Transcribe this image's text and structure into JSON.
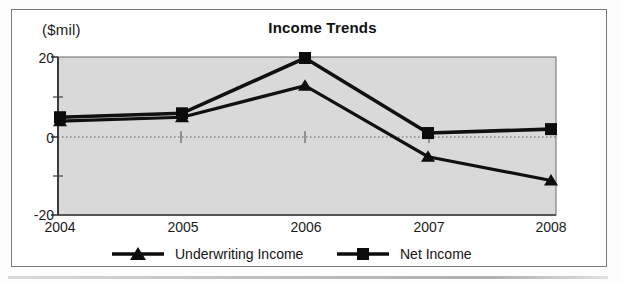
{
  "chart_data": {
    "type": "line",
    "title": "Income Trends",
    "xlabel": "",
    "ylabel": "($mil)",
    "unit_label": "($mil)",
    "categories": [
      "2004",
      "2005",
      "2006",
      "2007",
      "2008"
    ],
    "x": [
      2004,
      2005,
      2006,
      2007,
      2008
    ],
    "series": [
      {
        "name": "Underwriting Income",
        "marker": "triangle",
        "color": "#111111",
        "values": [
          4,
          5,
          13,
          -5,
          -11
        ]
      },
      {
        "name": "Net Income",
        "marker": "square",
        "color": "#111111",
        "values": [
          5,
          6,
          20,
          1,
          2
        ]
      }
    ],
    "ylim": [
      -20,
      20
    ],
    "yticks": [
      20,
      0,
      -20
    ],
    "ytick_labels": [
      "20",
      "0",
      "-20"
    ],
    "minor_yticks": [
      10,
      -10
    ],
    "grid": true,
    "gridline_style": "dotted",
    "legend_position": "bottom",
    "plot_background": "#d9d9d9",
    "plot_border_color": "#6b6b6b"
  },
  "chart": {
    "title": "Income Trends",
    "unit_label": "($mil)",
    "y_labels": {
      "top": "20",
      "middle": "0",
      "bottom": "-20"
    },
    "x_labels": [
      "2004",
      "2005",
      "2006",
      "2007",
      "2008"
    ],
    "legend": [
      {
        "label": "Underwriting Income",
        "marker": "triangle-marker-icon"
      },
      {
        "label": "Net Income",
        "marker": "square-marker-icon"
      }
    ]
  }
}
